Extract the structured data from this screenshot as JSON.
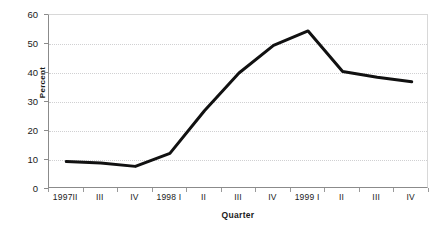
{
  "chart_data": {
    "type": "line",
    "title": "",
    "xlabel": "Quarter",
    "ylabel": "Percent",
    "categories": [
      "1997II",
      "III",
      "IV",
      "1998 I",
      "II",
      "III",
      "IV",
      "1999 I",
      "II",
      "III",
      "IV"
    ],
    "values": [
      9.5,
      9.0,
      7.8,
      12.3,
      27.0,
      40.0,
      49.5,
      54.5,
      40.5,
      38.5,
      37.0
    ],
    "series": [
      {
        "name": "Percent",
        "values": [
          9.5,
          9.0,
          7.8,
          12.3,
          27.0,
          40.0,
          49.5,
          54.5,
          40.5,
          38.5,
          37.0
        ],
        "color": "#111111"
      }
    ],
    "ylim": [
      0,
      60
    ],
    "yticks": [
      0,
      10,
      20,
      30,
      40,
      50,
      60
    ],
    "ytick_labels": [
      "0",
      "10",
      "20",
      "30",
      "40",
      "50",
      "60"
    ],
    "grid": true,
    "grid_axis": "y",
    "grid_style": "dotted",
    "grid_color": "#d0d0d2",
    "legend": false,
    "legend_position": "none",
    "line_width": 3,
    "markers": false,
    "background": "#ffffff",
    "axis_color": "#8b8b8b"
  }
}
